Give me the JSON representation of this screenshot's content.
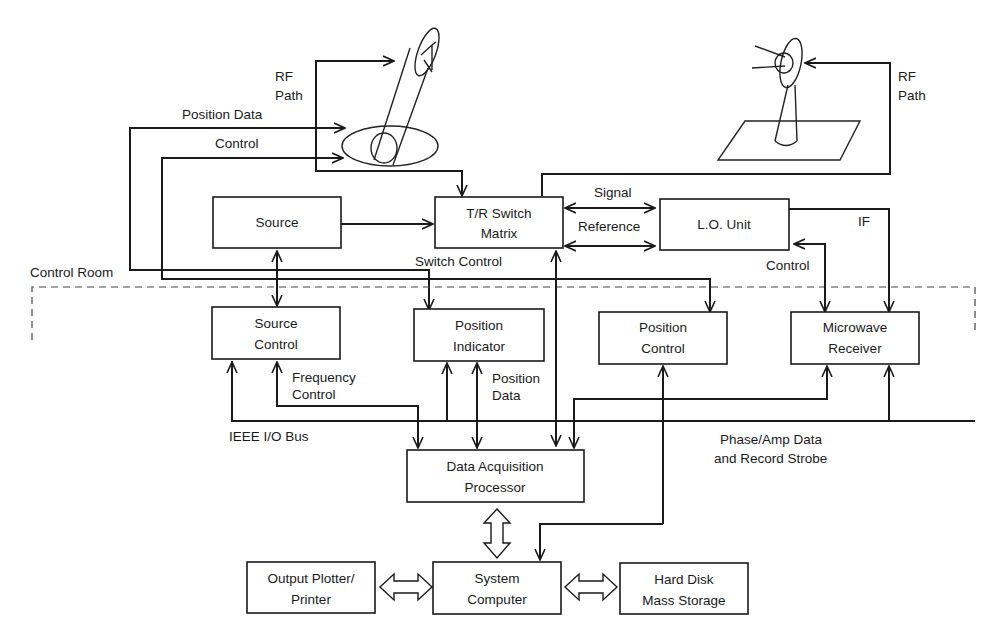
{
  "diagram": {
    "colors": {
      "ink": "#1a1a1a",
      "background": "#ffffff"
    },
    "regions": {
      "control_room": "Control Room"
    },
    "antennas": {
      "aut": {
        "name": "Antenna Under Test (positioner)",
        "rf_label_1": "RF",
        "rf_label_2": "Path"
      },
      "source": {
        "name": "Source Antenna",
        "rf_label_1": "RF",
        "rf_label_2": "Path"
      }
    },
    "blocks": {
      "source": {
        "line1": "Source"
      },
      "tr_switch": {
        "line1": "T/R Switch",
        "line2": "Matrix"
      },
      "lo_unit": {
        "line1": "L.O. Unit"
      },
      "source_control": {
        "line1": "Source",
        "line2": "Control"
      },
      "position_indicator": {
        "line1": "Position",
        "line2": "Indicator"
      },
      "position_control": {
        "line1": "Position",
        "line2": "Control"
      },
      "microwave_receiver": {
        "line1": "Microwave",
        "line2": "Receiver"
      },
      "dap": {
        "line1": "Data Acquisition",
        "line2": "Processor"
      },
      "output_plotter": {
        "line1": "Output Plotter/",
        "line2": "Printer"
      },
      "system_computer": {
        "line1": "System",
        "line2": "Computer"
      },
      "hard_disk": {
        "line1": "Hard Disk",
        "line2": "Mass Storage"
      }
    },
    "signals": {
      "position_data_top": "Position Data",
      "control_top": "Control",
      "signal": "Signal",
      "reference": "Reference",
      "if": "IF",
      "switch_control": "Switch Control",
      "lo_control": "Control",
      "frequency_control_1": "Frequency",
      "frequency_control_2": "Control",
      "position_data_1": "Position",
      "position_data_2": "Data",
      "ieee_bus": "IEEE I/O Bus",
      "phase_amp_1": "Phase/Amp Data",
      "phase_amp_2": "and Record Strobe"
    }
  }
}
